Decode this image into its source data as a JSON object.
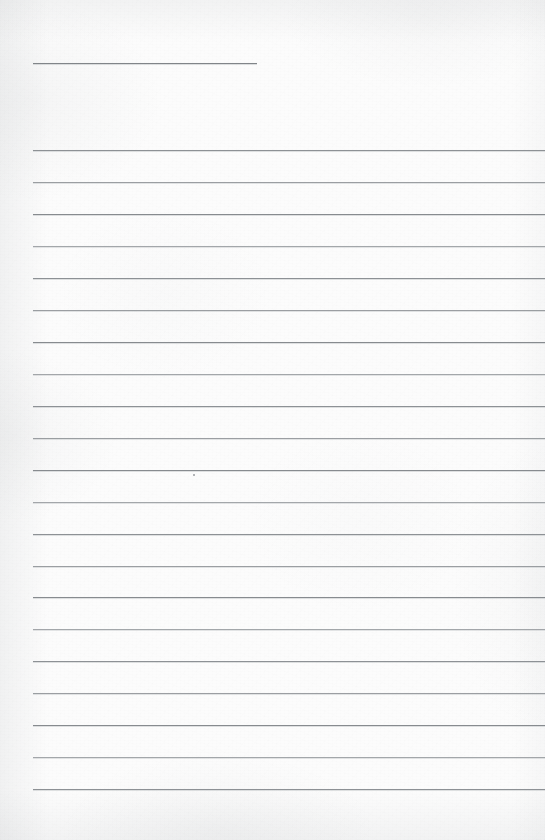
{
  "document": {
    "kind": "scanned-ruled-paper",
    "title": "",
    "page_width": 545,
    "page_height": 840,
    "content_text": "",
    "is_blank": true
  },
  "paper": {
    "background_color": "#fcfcfc",
    "edge_shadow_color": "#8c9196",
    "texture": "grain"
  },
  "heading_rule": {
    "label": "",
    "x": 33,
    "y": 63,
    "width": 224,
    "color": "#7d8185",
    "thickness": 1
  },
  "ruled_lines": {
    "count": 21,
    "left_x": 33,
    "right_x": 545,
    "first_y": 150,
    "spacing": 31.9,
    "color": "#8b8f93",
    "thickness": 1,
    "rows": [
      {
        "index": 1,
        "y": 150,
        "text": ""
      },
      {
        "index": 2,
        "y": 182,
        "text": ""
      },
      {
        "index": 3,
        "y": 214,
        "text": ""
      },
      {
        "index": 4,
        "y": 246,
        "text": ""
      },
      {
        "index": 5,
        "y": 278,
        "text": ""
      },
      {
        "index": 6,
        "y": 310,
        "text": ""
      },
      {
        "index": 7,
        "y": 342,
        "text": ""
      },
      {
        "index": 8,
        "y": 374,
        "text": ""
      },
      {
        "index": 9,
        "y": 406,
        "text": ""
      },
      {
        "index": 10,
        "y": 438,
        "text": ""
      },
      {
        "index": 11,
        "y": 470,
        "text": ""
      },
      {
        "index": 12,
        "y": 502,
        "text": ""
      },
      {
        "index": 13,
        "y": 534,
        "text": ""
      },
      {
        "index": 14,
        "y": 566,
        "text": ""
      },
      {
        "index": 15,
        "y": 597,
        "text": ""
      },
      {
        "index": 16,
        "y": 629,
        "text": ""
      },
      {
        "index": 17,
        "y": 661,
        "text": ""
      },
      {
        "index": 18,
        "y": 693,
        "text": ""
      },
      {
        "index": 19,
        "y": 725,
        "text": ""
      },
      {
        "index": 20,
        "y": 757,
        "text": ""
      },
      {
        "index": 21,
        "y": 789,
        "text": ""
      }
    ]
  },
  "marks": [
    {
      "name": "paper-speck",
      "x": 193,
      "y": 474,
      "size": 2,
      "color": "#6f7377"
    }
  ]
}
